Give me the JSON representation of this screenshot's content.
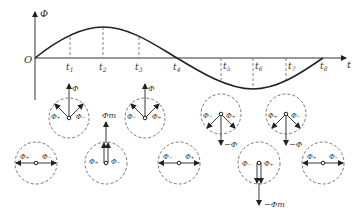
{
  "diagram": {
    "type": "rotating magnetic field flux waveform with phasor diagrams",
    "colors": {
      "line": "#222222",
      "dashed": "#666666",
      "text": "#333333",
      "background": "#ffffff"
    },
    "axes": {
      "y_label": "Φ",
      "x_label": "t",
      "origin_label": "O"
    },
    "ticks": [
      {
        "label": "t",
        "sub": "1"
      },
      {
        "label": "t",
        "sub": "2"
      },
      {
        "label": "t",
        "sub": "3"
      },
      {
        "label": "t",
        "sub": "4"
      },
      {
        "label": "t",
        "sub": "5"
      },
      {
        "label": "t",
        "sub": "6"
      },
      {
        "label": "t",
        "sub": "7"
      },
      {
        "label": "t",
        "sub": "8"
      }
    ],
    "waveform": "one full sine period from O to t8, peak at t2, trough at t6",
    "phasors": {
      "phi": "Φ",
      "phi_plus": "Φ₊",
      "phi_minus": "Φ₋",
      "phi_m": "Φm",
      "neg_phi": "−Φ",
      "neg_phi_m": "−Φm",
      "top_row": [
        {
          "position": "t1",
          "resultant": "Φ",
          "left": "Φ₊",
          "right": "Φ₋",
          "direction": "up"
        },
        {
          "position": "t3",
          "resultant": "Φ",
          "left": "Φ₋",
          "right": "Φ₊",
          "direction": "up"
        },
        {
          "position": "t5",
          "resultant": "−Φ",
          "left": "Φ₋",
          "right": "Φ₊",
          "direction": "down"
        },
        {
          "position": "t7",
          "resultant": "−Φ",
          "left": "Φ₊",
          "right": "Φ₋",
          "direction": "down"
        }
      ],
      "bottom_row": [
        {
          "position": "O",
          "left": "Φ₊",
          "right": "Φ₋",
          "direction": "horizontal"
        },
        {
          "position": "t2",
          "resultant": "Φm",
          "left": "Φ₊",
          "right": "Φ₋",
          "direction": "up"
        },
        {
          "position": "t4",
          "left": "Φ₋",
          "right": "Φ₊",
          "direction": "horizontal"
        },
        {
          "position": "t6",
          "resultant": "−Φm",
          "left": "Φ₋",
          "right": "Φ₊",
          "direction": "down"
        },
        {
          "position": "t8",
          "left": "Φ₊",
          "right": "Φ₋",
          "direction": "horizontal"
        }
      ]
    }
  }
}
